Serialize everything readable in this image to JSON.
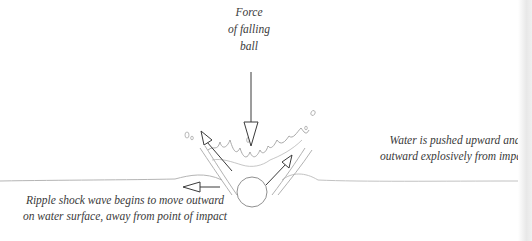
{
  "diagram": {
    "labels": {
      "force": [
        "Force",
        "of falling",
        "ball"
      ],
      "water": [
        "Water is pushed upward and",
        "outward explosively from impact of ball"
      ],
      "ripple": [
        "Ripple shock wave begins to move outward",
        "on water surface, away from  point of impact"
      ]
    },
    "arrows": [
      {
        "name": "force-of-falling-ball",
        "direction": "down"
      },
      {
        "name": "splash-up-left",
        "direction": "up-left"
      },
      {
        "name": "splash-up-right",
        "direction": "up-right"
      },
      {
        "name": "ripple-outward",
        "direction": "left"
      }
    ],
    "colors": {
      "ink": "#3a3a3a",
      "light_ink": "#9a9a9a",
      "background": "#ffffff"
    }
  }
}
